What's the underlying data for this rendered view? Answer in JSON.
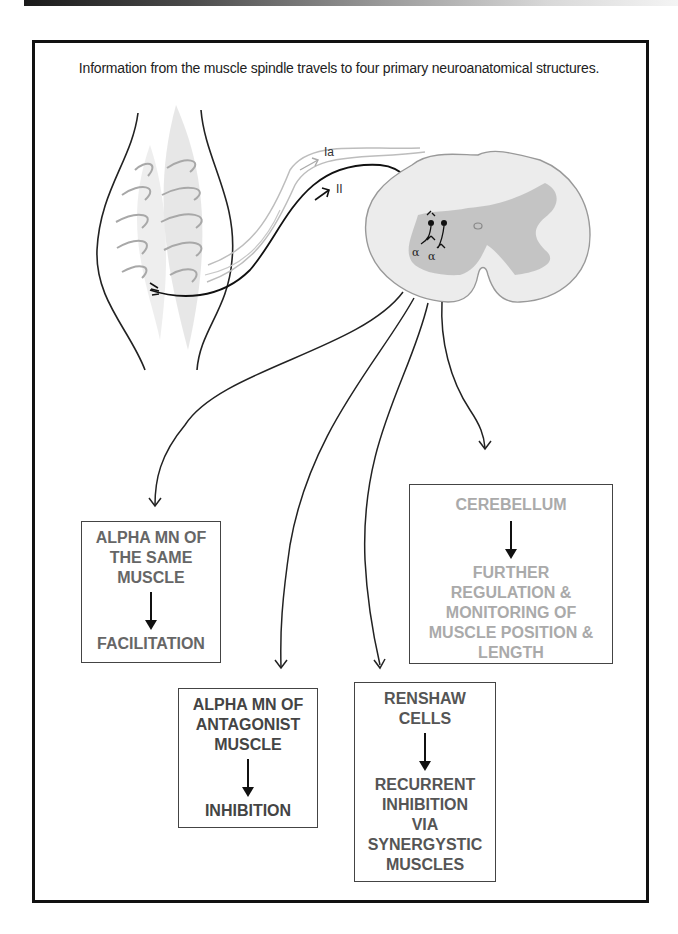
{
  "header": {
    "bar": "gradient-page-header"
  },
  "caption": "Information from the muscle spindle travels to four primary neuroanatomical structures.",
  "illustration": {
    "fiber_labels": {
      "ia": "Ia",
      "ii": "II"
    },
    "motor_neuron_labels": [
      "α",
      "α"
    ]
  },
  "boxes": {
    "same_muscle": {
      "title": "ALPHA MN OF\nTHE SAME\nMUSCLE",
      "result": "FACILITATION"
    },
    "antagonist": {
      "title": "ALPHA MN OF\nANTAGONIST\nMUSCLE",
      "result": "INHIBITION"
    },
    "renshaw": {
      "title": "RENSHAW\nCELLS",
      "result": "RECURRENT\nINHIBITION\nVIA\nSYNERGYSTIC\nMUSCLES"
    },
    "cerebellum": {
      "title": "CEREBELLUM",
      "result": "FURTHER\nREGULATION  &\nMONITORING OF\nMUSCLE POSITION &\nLENGTH"
    }
  },
  "colors": {
    "frame": "#111111",
    "box_text_dark": "#555555",
    "box_text_light": "#aaaaaa",
    "gray_matter": "#b8b8b8",
    "white_matter": "#e6e6e6"
  }
}
